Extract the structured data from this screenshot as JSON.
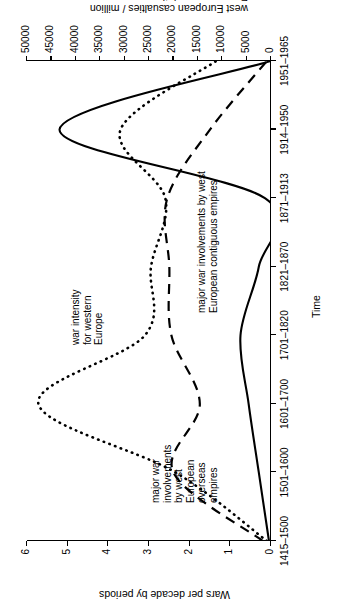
{
  "chart_data": {
    "type": "line",
    "title": "",
    "xlabel": "Time",
    "ylabel": "Wars per decade by periods",
    "y2label_line1": "west European casualties / million",
    "y2label_line2": "European population",
    "categories": [
      "1415–1500",
      "1501–1600",
      "1601–1700",
      "1701–1820",
      "1821–1870",
      "1871–1913",
      "1914–1950",
      "1951–1965"
    ],
    "ylim": [
      0,
      6
    ],
    "yticks": [
      "0",
      "1",
      "2",
      "3",
      "4",
      "5",
      "6"
    ],
    "y2lim": [
      0,
      50000
    ],
    "y2ticks": [
      "0",
      "5000",
      "10000",
      "15000",
      "20000",
      "25000",
      "30000",
      "35000",
      "40000",
      "45000",
      "50000"
    ],
    "grid": false,
    "legend": "annotations on plot",
    "series": [
      {
        "name": "war intensity for western Europe",
        "style": "solid",
        "axis": "right",
        "values": [
          0.05,
          0.3,
          0.55,
          0.75,
          0.3,
          0.15,
          5.2,
          0.0
        ]
      },
      {
        "name": "major war involvements by west European overseas empires",
        "style": "dotted",
        "axis": "left",
        "values": [
          0.1,
          2.35,
          5.72,
          3.1,
          2.95,
          2.6,
          3.7,
          1.35
        ]
      },
      {
        "name": "major war involvements by west European contiguous empires",
        "style": "dashed",
        "axis": "left",
        "values": [
          0.2,
          2.4,
          1.75,
          2.45,
          2.5,
          2.55,
          1.5,
          0.1
        ]
      }
    ],
    "annotations": [
      {
        "id": "war-intensity",
        "lines": [
          "war intensity",
          "for western",
          "Europe"
        ]
      },
      {
        "id": "overseas-empires",
        "lines": [
          "major war",
          "involvements",
          "by west",
          "European",
          "overseas",
          "empires"
        ]
      },
      {
        "id": "contiguous-empires",
        "lines": [
          "major war involvements by west",
          "European contiguous empires"
        ]
      }
    ]
  }
}
